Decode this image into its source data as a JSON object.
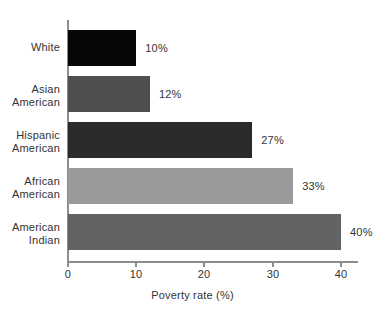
{
  "chart_data": {
    "type": "bar",
    "orientation": "horizontal",
    "title": "",
    "subtitle": "",
    "xlabel": "Poverty rate (%)",
    "ylabel": "",
    "xlim": [
      0,
      42.5
    ],
    "xticks": [
      "0",
      "10",
      "20",
      "30",
      "40"
    ],
    "xtick_values": [
      0,
      10,
      20,
      30,
      40
    ],
    "grid": false,
    "legend": "none",
    "categories": [
      "White",
      "Asian American",
      "Hispanic American",
      "African American",
      "American Indian"
    ],
    "values": [
      10,
      12,
      27,
      33,
      40
    ],
    "data_labels": [
      "10%",
      "12%",
      "27%",
      "33%",
      "40%"
    ],
    "bars": [
      {
        "category_line1": "White",
        "category_line2": "",
        "value": 10,
        "label": "10%",
        "color": "#070707"
      },
      {
        "category_line1": "Asian",
        "category_line2": "American",
        "value": 12,
        "label": "12%",
        "color": "#4f4f4f"
      },
      {
        "category_line1": "Hispanic",
        "category_line2": "American",
        "value": 27,
        "label": "27%",
        "color": "#2a2a2a"
      },
      {
        "category_line1": "African",
        "category_line2": "American",
        "value": 33,
        "label": "33%",
        "color": "#9a9a9a"
      },
      {
        "category_line1": "American",
        "category_line2": "Indian",
        "value": 40,
        "label": "40%",
        "color": "#636363"
      }
    ],
    "colors": {
      "background": "#ffffff",
      "axis": "#8d8d8d",
      "text": "#333333"
    }
  }
}
